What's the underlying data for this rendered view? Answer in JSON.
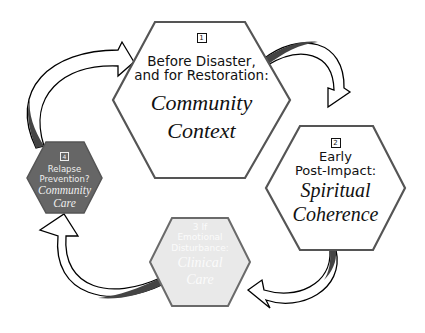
{
  "colors": {
    "outline": "#555555",
    "stage4_fill": "#666666",
    "stage3_fill": "#e9e9e9",
    "stage3_border": "#6a6a6a",
    "arrow_dark": "#444444",
    "background": "#ffffff"
  },
  "stages": [
    {
      "number": "1",
      "heading_line1": "Before Disaster,",
      "heading_line2": "and for Restoration:",
      "title_line1": "Community",
      "title_line2": "Context"
    },
    {
      "number": "2",
      "heading_line1": "Early",
      "heading_line2": "Post-Impact:",
      "title_line1": "Spiritual",
      "title_line2": "Coherence"
    },
    {
      "number": "3",
      "heading_line1": "If",
      "heading_line2": "Emotional",
      "heading_line3": "Disturbance:",
      "title_line1": "Clinical",
      "title_line2": "Care"
    },
    {
      "number": "4",
      "heading_line1": "Relapse",
      "heading_line2": "Prevention?",
      "title_line1": "Community",
      "title_line2": "Care"
    }
  ]
}
